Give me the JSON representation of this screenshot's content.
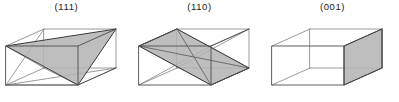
{
  "figure": {
    "type": "crystal-plane-diagram",
    "background_color": "#ffffff",
    "edge_color": "#4d4d4d",
    "hidden_edge_color": "#808080",
    "plane_fill_color": "#b3b3b3",
    "plane_outline_color": "#3a3a3a",
    "label_color": "#1a1a1a",
    "cells": [
      {
        "id": "111",
        "label": "(111)",
        "plane_shape": "triangle",
        "description": "Cubic unit cell with the (111) lattice plane shaded as a triangle cutting three corners"
      },
      {
        "id": "110",
        "label": "(110)",
        "plane_shape": "diagonal-parallelogram",
        "description": "Cubic unit cell with the (110) lattice plane shaded as a diagonal rectangle through two opposite edges"
      },
      {
        "id": "001",
        "label": "(001)",
        "plane_shape": "face",
        "description": "Cubic unit cell with the (001) lattice plane shaded as the right hand cube face"
      }
    ]
  }
}
